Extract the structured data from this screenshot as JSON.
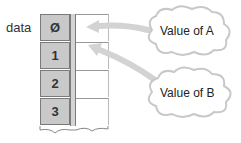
{
  "diagram": {
    "array_label": "data",
    "cells": [
      {
        "index_label": "Ø"
      },
      {
        "index_label": "1"
      },
      {
        "index_label": "2"
      },
      {
        "index_label": "3"
      }
    ],
    "callouts": [
      {
        "text": "Value of A",
        "points_to_cell": 0
      },
      {
        "text": "Value of B",
        "points_to_cell": 1
      }
    ],
    "colors": {
      "index_cell_fill": "#c9c9c9",
      "arrow": "#d0d0d0",
      "cloud_outline": "#c8c8c8"
    }
  }
}
